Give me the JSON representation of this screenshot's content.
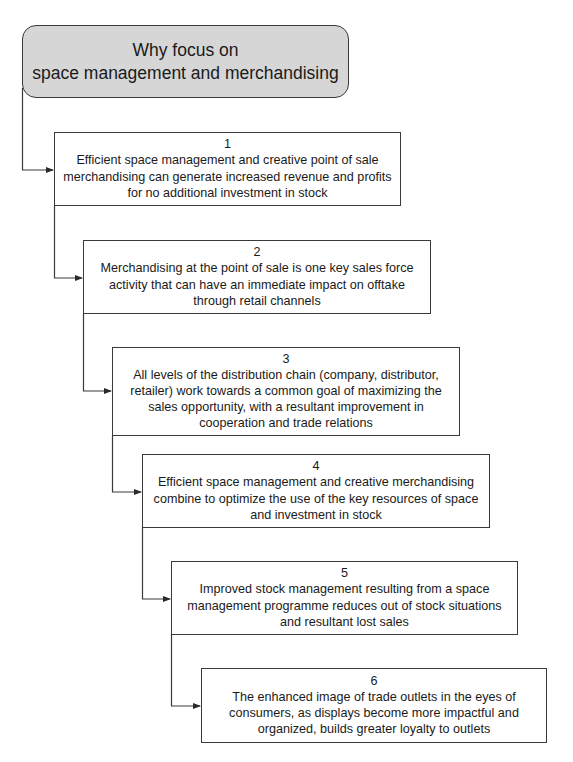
{
  "diagram": {
    "title_line1": "Why focus on",
    "title_line2": "space management and merchandising",
    "header_fill": "#d6d6d6",
    "line_color": "#3a3a3a",
    "steps": [
      {
        "number": "1",
        "text": "Efficient space management and creative point of sale merchandising can generate increased revenue and profits for no additional investment in stock"
      },
      {
        "number": "2",
        "text": "Merchandising at the point of sale is one key sales force activity that can have an immediate impact on offtake through retail channels"
      },
      {
        "number": "3",
        "text": "All levels of the distribution chain (company, distributor, retailer) work towards a common goal of maximizing the sales opportunity, with a resultant improvement in cooperation and trade relations"
      },
      {
        "number": "4",
        "text": "Efficient space management and creative merchandising combine to optimize the use of the key resources of space and investment in stock"
      },
      {
        "number": "5",
        "text": "Improved stock management resulting from a space management programme reduces out of stock situations and resultant lost sales"
      },
      {
        "number": "6",
        "text": "The enhanced image of trade outlets in the eyes of consumers, as displays become more impactful and organized, builds greater loyalty to outlets"
      }
    ]
  }
}
